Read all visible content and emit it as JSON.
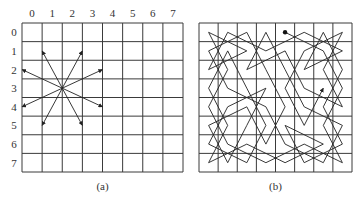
{
  "figure": {
    "panel_a": {
      "caption": "(a)",
      "grid": {
        "x": 22,
        "y": 23,
        "width": 161,
        "height": 149,
        "cols": 8,
        "rows": 8
      },
      "column_labels": [
        "0",
        "1",
        "2",
        "3",
        "4",
        "5",
        "6",
        "7"
      ],
      "row_labels": [
        "0",
        "1",
        "2",
        "3",
        "4",
        "5",
        "6",
        "7"
      ],
      "knight_origin": {
        "col_line": 2,
        "row_line": 3.5
      },
      "moves": [
        {
          "dx": -1,
          "dy": -2
        },
        {
          "dx": 1,
          "dy": -2
        },
        {
          "dx": -2,
          "dy": -1
        },
        {
          "dx": 2,
          "dy": -1
        },
        {
          "dx": -2,
          "dy": 1
        },
        {
          "dx": 2,
          "dy": 1
        },
        {
          "dx": -1,
          "dy": 2
        },
        {
          "dx": 1,
          "dy": 2
        }
      ]
    },
    "panel_b": {
      "caption": "(b)",
      "grid": {
        "x": 199,
        "y": 23,
        "width": 153,
        "height": 149,
        "cols": 8,
        "rows": 8
      },
      "tour_start": {
        "row": 0,
        "col": 4
      },
      "tour_description": "Knight's tour visiting all 64 squares, starting at dot and ending with arrow"
    },
    "colors": {
      "line": "#222222",
      "grid": "#3a3a3a",
      "background": "#ffffff"
    }
  }
}
